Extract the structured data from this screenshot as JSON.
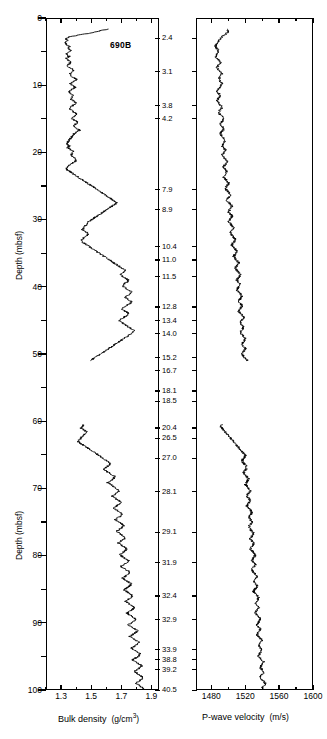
{
  "figure": {
    "hole_label": "690B",
    "depth_axis_title": "Depth (mbsf)"
  },
  "left_axis": {
    "title": "Depth (mbsf)",
    "ticks": [
      0,
      10,
      20,
      30,
      40,
      50,
      60,
      70,
      80,
      90,
      100
    ],
    "minor_step": 5,
    "range": [
      0,
      100
    ]
  },
  "middle_column": {
    "labels": [
      "2.4",
      "3.1",
      "3.8",
      "4.2",
      "7.9",
      "8.9",
      "10.4",
      "11.0",
      "11.5",
      "12.8",
      "13.4",
      "14.0",
      "15.2",
      "16.7",
      "18.1",
      "18.5",
      "20.4",
      "26.5",
      "27.0",
      "28.1",
      "29.1",
      "31.9",
      "32.4",
      "32.9",
      "33.9",
      "38.8",
      "39.2",
      "40.5"
    ],
    "depths": [
      3.0,
      8.0,
      13.0,
      15.0,
      25.5,
      28.5,
      34.0,
      36.0,
      38.5,
      43.0,
      45.0,
      47.0,
      50.5,
      52.5,
      55.5,
      57.0,
      61.0,
      62.5,
      65.5,
      70.5,
      76.5,
      81.0,
      86.0,
      89.5,
      94.0,
      95.5,
      97.0,
      100.0
    ]
  },
  "chart_data": [
    {
      "type": "line",
      "name": "bulk-density",
      "title": "690B",
      "xlabel": "Bulk density  (g/cm3)",
      "ylabel": "Depth (mbsf)",
      "xlim": [
        1.2,
        1.95
      ],
      "ylim": [
        0,
        100
      ],
      "xticks": [
        1.3,
        1.5,
        1.7,
        1.9
      ],
      "xtick_labels": [
        "1.3",
        "1.5",
        "1.7",
        "1.9"
      ],
      "xminor_step": 0.1,
      "yticks": [
        0,
        10,
        20,
        30,
        40,
        50,
        60,
        70,
        80,
        90,
        100
      ],
      "grid": false,
      "legend": "none",
      "units": "g/cm3",
      "series": [
        {
          "name": "Bulk density",
          "x": [
            1.62,
            1.55,
            1.5,
            1.42,
            1.35,
            1.33,
            1.34,
            1.32,
            1.33,
            1.35,
            1.34,
            1.36,
            1.34,
            1.33,
            1.35,
            1.33,
            1.34,
            1.36,
            1.35,
            1.34,
            1.36,
            1.38,
            1.37,
            1.35,
            1.36,
            1.38,
            1.4,
            1.38,
            1.36,
            1.37,
            1.39,
            1.37,
            1.35,
            1.36,
            1.38,
            1.37,
            1.36,
            1.38,
            1.4,
            1.38,
            1.36,
            1.35,
            1.37,
            1.39,
            1.4,
            1.38,
            1.37,
            1.39,
            1.41,
            1.39,
            1.38,
            1.4,
            1.42,
            1.4,
            1.38,
            1.37,
            1.36,
            1.35,
            1.34,
            1.33,
            1.35,
            1.34,
            1.36,
            1.38,
            1.37,
            1.36,
            1.38,
            1.4,
            1.39,
            1.37,
            1.35,
            1.34,
            1.33,
            1.35,
            1.37,
            1.39,
            1.41,
            1.43,
            1.45,
            1.47,
            1.49,
            1.51,
            1.53,
            1.55,
            1.57,
            1.59,
            1.61,
            1.63,
            1.65,
            1.67,
            1.66,
            1.64,
            1.62,
            1.6,
            1.58,
            1.56,
            1.54,
            1.52,
            1.5,
            1.48,
            1.47,
            1.46,
            1.45,
            1.44,
            1.46,
            1.48,
            1.47,
            1.45,
            1.44,
            1.43,
            1.45,
            1.47,
            1.49,
            1.51,
            1.53,
            1.55,
            1.57,
            1.59,
            1.61,
            1.63,
            1.65,
            1.67,
            1.69,
            1.71,
            1.73,
            1.72,
            1.7,
            1.71,
            1.73,
            1.75,
            1.74,
            1.72,
            1.71,
            1.73,
            1.75,
            1.77,
            1.76,
            1.74,
            1.73,
            1.75,
            1.77,
            1.76,
            1.74,
            1.72,
            1.71,
            1.73,
            1.75,
            1.74,
            1.72,
            1.7,
            1.69,
            1.71,
            1.73,
            1.75,
            1.77,
            1.79,
            1.78,
            1.76,
            1.74,
            1.72,
            1.7,
            1.68,
            1.66,
            1.64,
            1.62,
            1.6,
            1.58,
            1.56,
            1.54,
            1.52,
            1.5,
            1.48,
            1.46,
            1.44,
            1.42,
            1.41,
            1.43,
            1.42,
            1.41,
            1.4,
            1.42,
            1.44,
            1.43,
            1.42,
            1.44,
            1.46,
            1.48,
            1.47,
            1.45,
            1.44,
            1.46,
            1.48,
            1.5,
            1.49,
            1.47,
            1.46,
            1.48,
            1.5,
            1.52,
            1.51,
            1.49,
            1.48,
            1.46,
            1.45,
            1.44,
            1.43,
            1.45,
            1.47,
            1.46,
            1.44,
            1.43,
            1.42,
            1.41,
            1.43,
            1.45,
            1.47,
            1.49,
            1.51,
            1.53,
            1.55,
            1.57,
            1.59,
            1.61,
            1.63,
            1.62,
            1.6,
            1.58,
            1.6,
            1.62,
            1.64,
            1.66,
            1.65,
            1.63,
            1.61,
            1.63,
            1.65,
            1.67,
            1.69,
            1.68,
            1.66,
            1.64,
            1.66,
            1.68,
            1.7,
            1.69,
            1.67,
            1.65,
            1.67,
            1.69,
            1.71,
            1.7,
            1.68,
            1.66,
            1.68,
            1.7,
            1.72,
            1.71,
            1.69,
            1.67,
            1.69,
            1.71,
            1.73,
            1.72,
            1.7,
            1.68,
            1.7,
            1.72,
            1.74,
            1.73,
            1.71,
            1.69,
            1.71,
            1.73,
            1.75,
            1.74,
            1.72,
            1.7,
            1.72,
            1.74,
            1.76,
            1.75,
            1.73,
            1.71,
            1.73,
            1.75,
            1.77,
            1.76,
            1.74,
            1.72,
            1.74,
            1.76,
            1.78,
            1.77,
            1.75,
            1.73,
            1.75,
            1.77,
            1.79,
            1.78,
            1.76,
            1.74,
            1.76,
            1.78,
            1.8,
            1.79,
            1.77,
            1.75,
            1.77,
            1.79,
            1.81,
            1.8,
            1.78,
            1.76,
            1.78,
            1.8,
            1.82,
            1.81,
            1.79,
            1.77,
            1.79,
            1.81,
            1.83,
            1.82,
            1.8,
            1.78,
            1.8,
            1.82,
            1.84,
            1.83,
            1.81,
            1.79,
            1.81,
            1.83,
            1.85,
            1.84,
            1.82,
            1.8,
            1.82,
            1.84,
            1.86
          ],
          "y_start": 1.5,
          "y_end": 100.0,
          "gaps": [
            [
              51.0,
              60.5
            ]
          ]
        }
      ]
    },
    {
      "type": "line",
      "name": "p-wave-velocity",
      "xlabel": "P-wave velocity  (m/s)",
      "ylabel": "Depth (mbsf)",
      "xlim": [
        1462,
        1600
      ],
      "ylim": [
        0,
        100
      ],
      "xticks": [
        1480,
        1520,
        1560,
        1600
      ],
      "xtick_labels": [
        "1480",
        "1520",
        "1560",
        "1600"
      ],
      "xminor_step": 20,
      "yticks": [
        0,
        10,
        20,
        30,
        40,
        50,
        60,
        70,
        80,
        90,
        100
      ],
      "grid": false,
      "legend": "none",
      "units": "m/s",
      "series": [
        {
          "name": "P-wave velocity",
          "x": [
            1497,
            1500,
            1498,
            1495,
            1492,
            1490,
            1488,
            1486,
            1485,
            1484,
            1486,
            1488,
            1487,
            1485,
            1484,
            1486,
            1488,
            1490,
            1489,
            1487,
            1486,
            1488,
            1490,
            1492,
            1491,
            1489,
            1488,
            1490,
            1492,
            1491,
            1489,
            1487,
            1486,
            1488,
            1490,
            1489,
            1487,
            1486,
            1488,
            1490,
            1492,
            1491,
            1489,
            1488,
            1490,
            1492,
            1494,
            1493,
            1491,
            1490,
            1492,
            1494,
            1493,
            1491,
            1490,
            1492,
            1494,
            1496,
            1495,
            1493,
            1492,
            1494,
            1496,
            1495,
            1493,
            1492,
            1494,
            1496,
            1498,
            1497,
            1495,
            1494,
            1496,
            1498,
            1497,
            1495,
            1494,
            1496,
            1498,
            1500,
            1499,
            1497,
            1496,
            1498,
            1500,
            1502,
            1501,
            1499,
            1498,
            1500,
            1502,
            1504,
            1503,
            1501,
            1500,
            1502,
            1504,
            1503,
            1501,
            1500,
            1502,
            1504,
            1506,
            1505,
            1503,
            1502,
            1504,
            1506,
            1508,
            1507,
            1505,
            1504,
            1506,
            1508,
            1510,
            1509,
            1507,
            1506,
            1508,
            1510,
            1512,
            1511,
            1509,
            1508,
            1510,
            1512,
            1514,
            1513,
            1511,
            1510,
            1512,
            1514,
            1513,
            1511,
            1510,
            1512,
            1514,
            1516,
            1515,
            1513,
            1512,
            1514,
            1516,
            1515,
            1513,
            1512,
            1514,
            1516,
            1518,
            1517,
            1515,
            1514,
            1516,
            1518,
            1517,
            1515,
            1514,
            1516,
            1518,
            1520,
            1519,
            1517,
            1516,
            1518,
            1520,
            1519,
            1517,
            1516,
            1518,
            1520,
            1522,
            1521,
            1519,
            1518,
            1520,
            1522,
            1521,
            1519,
            1518,
            1520,
            1522,
            1524,
            1523,
            1521,
            1520,
            1522,
            1524,
            1523,
            1521,
            1520,
            1518,
            1516,
            1514,
            1512,
            1510,
            1508,
            1506,
            1504,
            1502,
            1500,
            1498,
            1496,
            1494,
            1492,
            1490,
            1492,
            1494,
            1496,
            1498,
            1500,
            1502,
            1504,
            1506,
            1508,
            1510,
            1512,
            1514,
            1516,
            1518,
            1520,
            1519,
            1517,
            1516,
            1518,
            1520,
            1522,
            1521,
            1519,
            1518,
            1520,
            1522,
            1524,
            1523,
            1521,
            1520,
            1522,
            1524,
            1526,
            1525,
            1523,
            1522,
            1524,
            1526,
            1525,
            1523,
            1522,
            1524,
            1526,
            1528,
            1527,
            1525,
            1524,
            1526,
            1528,
            1527,
            1525,
            1524,
            1526,
            1528,
            1530,
            1529,
            1527,
            1526,
            1528,
            1530,
            1529,
            1527,
            1526,
            1528,
            1530,
            1532,
            1531,
            1529,
            1528,
            1530,
            1532,
            1531,
            1529,
            1528,
            1530,
            1532,
            1534,
            1533,
            1531,
            1530,
            1532,
            1534,
            1533,
            1531,
            1530,
            1532,
            1534,
            1536,
            1535,
            1533,
            1532,
            1534,
            1536,
            1535,
            1533,
            1532,
            1534,
            1536,
            1538,
            1537,
            1535,
            1534,
            1536,
            1538,
            1537,
            1535,
            1534,
            1536,
            1538,
            1540,
            1539,
            1537,
            1536,
            1538,
            1540,
            1539,
            1537,
            1536,
            1538,
            1540,
            1542,
            1541,
            1539,
            1538,
            1540,
            1542,
            1541,
            1539,
            1538,
            1540,
            1542,
            1544,
            1543,
            1541,
            1540
          ],
          "y_start": 1.5,
          "y_end": 100.0,
          "gaps": [
            [
              51.0,
              60.5
            ]
          ]
        }
      ]
    }
  ]
}
